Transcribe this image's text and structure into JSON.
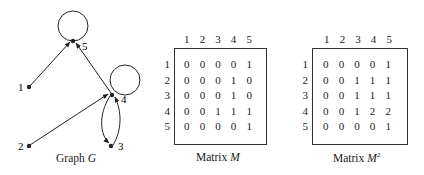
{
  "graph": {
    "caption_prefix": "Graph ",
    "caption_var": "G",
    "nodes": [
      {
        "id": "1",
        "label": "1"
      },
      {
        "id": "2",
        "label": "2"
      },
      {
        "id": "3",
        "label": "3"
      },
      {
        "id": "4",
        "label": "4"
      },
      {
        "id": "5",
        "label": "5"
      }
    ],
    "edges": [
      {
        "from": "1",
        "to": "5"
      },
      {
        "from": "2",
        "to": "4"
      },
      {
        "from": "4",
        "to": "5"
      },
      {
        "from": "4",
        "to": "3"
      },
      {
        "from": "3",
        "to": "4"
      },
      {
        "from": "4",
        "to": "4"
      },
      {
        "from": "5",
        "to": "5"
      }
    ]
  },
  "matrix_m": {
    "caption_prefix": "Matrix ",
    "caption_var": "M",
    "col_headers": [
      "1",
      "2",
      "3",
      "4",
      "5"
    ],
    "row_headers": [
      "1",
      "2",
      "3",
      "4",
      "5"
    ],
    "rows": [
      [
        "0",
        "0",
        "0",
        "0",
        "1"
      ],
      [
        "0",
        "0",
        "0",
        "1",
        "0"
      ],
      [
        "0",
        "0",
        "0",
        "1",
        "0"
      ],
      [
        "0",
        "0",
        "1",
        "1",
        "1"
      ],
      [
        "0",
        "0",
        "0",
        "0",
        "1"
      ]
    ]
  },
  "matrix_m2": {
    "caption_prefix": "Matrix ",
    "caption_var": "M",
    "caption_sup": "2",
    "col_headers": [
      "1",
      "2",
      "3",
      "4",
      "5"
    ],
    "row_headers": [
      "1",
      "2",
      "3",
      "4",
      "5"
    ],
    "rows": [
      [
        "0",
        "0",
        "0",
        "0",
        "1"
      ],
      [
        "0",
        "0",
        "1",
        "1",
        "1"
      ],
      [
        "0",
        "0",
        "1",
        "1",
        "1"
      ],
      [
        "0",
        "0",
        "1",
        "2",
        "2"
      ],
      [
        "0",
        "0",
        "0",
        "0",
        "1"
      ]
    ]
  }
}
